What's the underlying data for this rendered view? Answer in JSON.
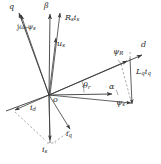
{
  "figure": {
    "background_color": "#ffffff",
    "line_color": "#3a3a3a",
    "dash_color": "#6e6e6e",
    "width": 161,
    "height": 164,
    "origin": {
      "x": 49,
      "y": 95,
      "label": "o"
    }
  },
  "axes": [
    {
      "id": "d-axis",
      "label": "d",
      "label_x": 143,
      "label_y": 47,
      "description": "rotor direct axis, pointing up-right"
    },
    {
      "id": "q-axis",
      "label": "q",
      "label_x": 11,
      "label_y": 8,
      "description": "rotor quadrature axis, pointing up-left"
    },
    {
      "id": "beta-axis",
      "label": "β",
      "label_x": 45,
      "label_y": 6,
      "description": "stationary beta axis, vertical up"
    },
    {
      "id": "alpha-axis",
      "label": "α",
      "label_x": 111,
      "label_y": 86,
      "description": "stationary alpha axis, horizontal right"
    }
  ],
  "vectors": [
    {
      "id": "jwr-psi-s",
      "label": "jω",
      "label_sub": "r",
      "label_tail": "ψ",
      "label_tail_sub": "s",
      "label_full": "jωrψs",
      "label_x": 21,
      "label_y": 26,
      "description": "back-EMF vector, up-left along q axis"
    },
    {
      "id": "Rs-is",
      "label_full": "Rsis",
      "label_main": "R",
      "label_sub": "s",
      "label_second": "i",
      "label_second_sub": "s",
      "label_x": 67,
      "label_y": 17,
      "description": "stator resistive drop, up-right of beta axis"
    },
    {
      "id": "us",
      "label_main": "u",
      "label_sub": "s",
      "label_x": 58,
      "label_y": 42,
      "description": "stator voltage vector"
    },
    {
      "id": "psi-R",
      "label_main": "ψ",
      "label_sub": "R",
      "label_x": 115,
      "label_y": 51,
      "description": "rotor/PM flux linkage along d axis"
    },
    {
      "id": "psi-s",
      "label_main": "ψ",
      "label_sub": "s",
      "label_x": 118,
      "label_y": 101,
      "description": "stator flux linkage vector"
    },
    {
      "id": "Lq-iq",
      "label_main": "L",
      "label_sub": "q",
      "label_second": "i",
      "label_second_sub": "q",
      "label_x": 139,
      "label_y": 70,
      "description": "q-axis inductive flux component, vertical down from psi-R tip to psi-s tip"
    },
    {
      "id": "is",
      "label_main": "i",
      "label_sub": "s",
      "label_x": 44,
      "label_y": 148,
      "description": "stator current vector, pointing down"
    },
    {
      "id": "id",
      "label_main": "i",
      "label_sub": "d",
      "label_x": 32,
      "label_y": 107,
      "description": "d-axis current component, down-left"
    },
    {
      "id": "iq",
      "label_main": "i",
      "label_sub": "q",
      "label_x": 68,
      "label_y": 133,
      "description": "q-axis current component, down-right"
    }
  ],
  "angles": [
    {
      "id": "theta-r",
      "label_main": "θ",
      "label_sub": "r",
      "label_x": 86,
      "label_y": 86,
      "description": "rotor angle between alpha axis and d axis"
    },
    {
      "id": "alpha-angle",
      "label_main": "α",
      "label_x": 111,
      "label_y": 86,
      "description": "angle marker near alpha axis arrow"
    }
  ],
  "origin_label": {
    "text": "o",
    "x": 52,
    "y": 99
  }
}
